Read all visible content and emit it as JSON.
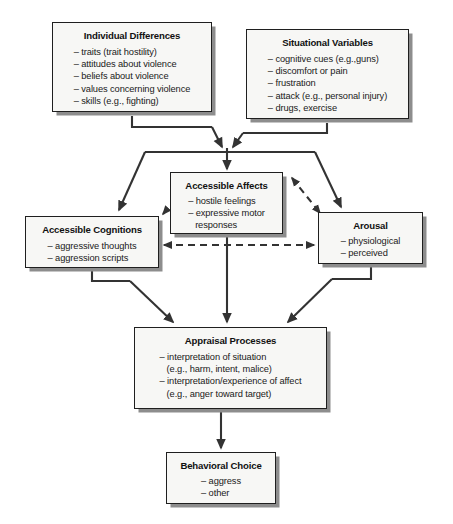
{
  "diagram": {
    "type": "flowchart",
    "nodes": {
      "individual_differences": {
        "title": "Individual Differences",
        "items": [
          "– traits (trait hostility)",
          "– attitudes about violence",
          "– beliefs about violence",
          "– values concerning violence",
          "– skills (e.g., fighting)"
        ]
      },
      "situational_variables": {
        "title": "Situational Variables",
        "items": [
          "– cognitive cues (e.g.,guns)",
          "– discomfort or pain",
          "– frustration",
          "– attack (e.g., personal injury)",
          "– drugs, exercise"
        ]
      },
      "accessible_affects": {
        "title": "Accessible Affects",
        "items": [
          "– hostile feelings",
          "– expressive motor\n   responses"
        ]
      },
      "accessible_cognitions": {
        "title": "Accessible Cognitions",
        "items": [
          "– aggressive thoughts",
          "– aggression scripts"
        ]
      },
      "arousal": {
        "title": "Arousal",
        "items": [
          "– physiological",
          "– perceived"
        ]
      },
      "appraisal_processes": {
        "title": "Appraisal Processes",
        "items": [
          "– interpretation of situation\n   (e.g., harm, intent, malice)",
          "– interpretation/experience of affect\n   (e.g., anger toward target)"
        ]
      },
      "behavioral_choice": {
        "title": "Behavioral Choice",
        "items": [
          "– aggress",
          "– other"
        ]
      }
    },
    "connectors": [
      {
        "name": "individual-differences-to-junction",
        "style": "solid",
        "arrow": "single"
      },
      {
        "name": "situational-variables-to-junction",
        "style": "solid",
        "arrow": "single"
      },
      {
        "name": "junction-to-accessible-affects",
        "style": "solid",
        "arrow": "single"
      },
      {
        "name": "junction-to-accessible-cognitions",
        "style": "solid",
        "arrow": "single"
      },
      {
        "name": "junction-to-arousal",
        "style": "solid",
        "arrow": "single"
      },
      {
        "name": "affects-cognitions-link",
        "style": "dashed",
        "arrow": "double"
      },
      {
        "name": "affects-arousal-link",
        "style": "dashed",
        "arrow": "double"
      },
      {
        "name": "cognitions-arousal-link",
        "style": "dashed",
        "arrow": "double"
      },
      {
        "name": "cognitions-to-appraisal",
        "style": "solid",
        "arrow": "single"
      },
      {
        "name": "affects-to-appraisal",
        "style": "solid",
        "arrow": "single"
      },
      {
        "name": "arousal-to-appraisal",
        "style": "solid",
        "arrow": "single"
      },
      {
        "name": "appraisal-to-behavioral-choice",
        "style": "solid",
        "arrow": "single"
      }
    ],
    "colors": {
      "box_fill": "#f7f7f5",
      "box_border": "#1f1f1f",
      "box_shadow": "#8d8d8d",
      "connector": "#333333",
      "text": "#1a1a1a",
      "background": "#ffffff"
    }
  }
}
